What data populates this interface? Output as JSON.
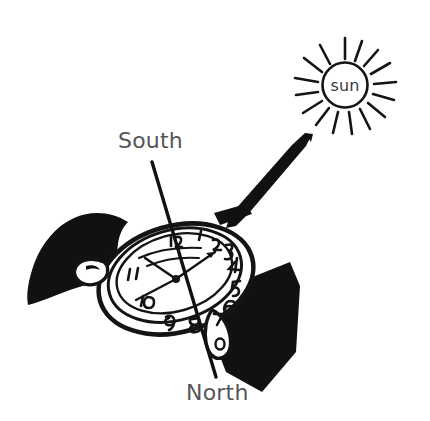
{
  "figure": {
    "background_color": "#ffffff",
    "ink_color": "#111111",
    "label_color": "#555557",
    "width": 430,
    "height": 421
  },
  "labels": {
    "south": "South",
    "north": "North",
    "sun": "sun"
  },
  "sun": {
    "center_x": 345,
    "center_y": 85,
    "radius": 22,
    "ray_count": 16,
    "ray_length": 19,
    "label": "sun"
  },
  "sunbeam": {
    "description": "tapered black wedge from sun to watch face",
    "tip_x": 310,
    "tip_y": 137,
    "base_x": 231,
    "base_y": 221
  },
  "direction_line": {
    "description": "north-south line through watch centre",
    "south_x": 152,
    "south_y": 162,
    "north_x": 216,
    "north_y": 377,
    "stroke_width": 3.2
  },
  "watch": {
    "center_x": 176,
    "center_y": 279,
    "case_rx": 78,
    "case_ry": 52,
    "rotation_deg": -16,
    "dial_rx": 60,
    "dial_ry": 40,
    "band_color": "#111111",
    "dial_numerals": [
      "12",
      "1",
      "2",
      "3",
      "4",
      "5",
      "6",
      "7",
      "8",
      "9",
      "10",
      "11"
    ],
    "hands": [
      {
        "name": "hour-hand",
        "angle_deg": 236,
        "length": 38
      },
      {
        "name": "minute-hand",
        "angle_deg": 140,
        "length": 52
      },
      {
        "name": "second-hand",
        "angle_deg": 78,
        "length": 44
      }
    ]
  }
}
